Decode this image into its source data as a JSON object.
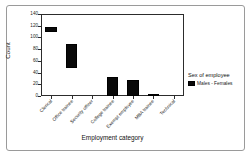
{
  "chart_data": {
    "type": "bar",
    "title": "",
    "xlabel": "Employment category",
    "ylabel": "Count",
    "ylim": [
      0,
      140
    ],
    "yticks": [
      0,
      20,
      40,
      60,
      80,
      100,
      120,
      140
    ],
    "grid": false,
    "bar_style": "floating-range",
    "categories": [
      "Clerical",
      "Office trainee",
      "Security officer",
      "College trainee",
      "Exempt employee",
      "MBA trainee",
      "Technical"
    ],
    "series": [
      {
        "name": "Males - Females",
        "color": "#090909",
        "bars": [
          {
            "category": "Clerical",
            "low": 110,
            "high": 118
          },
          {
            "category": "Office trainee",
            "low": 47,
            "high": 88
          },
          {
            "category": "Security officer",
            "low": 0,
            "high": 0
          },
          {
            "category": "College trainee",
            "low": 0,
            "high": 32
          },
          {
            "category": "Exempt employee",
            "low": 0,
            "high": 27
          },
          {
            "category": "MBA trainee",
            "low": 0,
            "high": 3
          },
          {
            "category": "Technical",
            "low": 0,
            "high": 0
          }
        ]
      }
    ],
    "legend": {
      "position": "right",
      "title": "Sex of employee",
      "entries": [
        {
          "label": "Males - Females",
          "color": "#090909"
        }
      ]
    }
  }
}
